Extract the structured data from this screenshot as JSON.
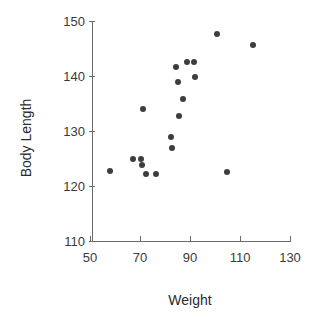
{
  "chart_data": {
    "type": "scatter",
    "title": "",
    "xlabel": "Weight",
    "ylabel": "Body Length",
    "xlim": [
      50,
      130
    ],
    "ylim": [
      110,
      150
    ],
    "xticks": [
      50,
      70,
      90,
      110,
      130
    ],
    "yticks": [
      110,
      120,
      130,
      140,
      150
    ],
    "grid": false,
    "legend": null,
    "marker": {
      "shape": "circle",
      "color": "#3d3d3d",
      "size_px": 6
    },
    "axis_color": "#6b6b6b",
    "series": [
      {
        "name": "observations",
        "points": [
          {
            "x": 58.0,
            "y": 122.7
          },
          {
            "x": 67.2,
            "y": 124.9
          },
          {
            "x": 70.4,
            "y": 124.9
          },
          {
            "x": 70.8,
            "y": 123.8
          },
          {
            "x": 71.2,
            "y": 134.0
          },
          {
            "x": 72.4,
            "y": 122.2
          },
          {
            "x": 76.4,
            "y": 122.2
          },
          {
            "x": 82.4,
            "y": 128.9
          },
          {
            "x": 82.8,
            "y": 126.9
          },
          {
            "x": 84.4,
            "y": 141.6
          },
          {
            "x": 85.2,
            "y": 138.9
          },
          {
            "x": 85.6,
            "y": 132.8
          },
          {
            "x": 87.2,
            "y": 135.9
          },
          {
            "x": 88.8,
            "y": 142.6
          },
          {
            "x": 91.6,
            "y": 142.6
          },
          {
            "x": 92.0,
            "y": 139.8
          },
          {
            "x": 100.8,
            "y": 147.7
          },
          {
            "x": 104.8,
            "y": 122.6
          },
          {
            "x": 115.2,
            "y": 145.7
          }
        ]
      }
    ]
  },
  "axes": {
    "x": {
      "title": "Weight",
      "tick_labels": [
        "50",
        "70",
        "90",
        "110",
        "130"
      ]
    },
    "y": {
      "title": "Body Length",
      "tick_labels": [
        "110",
        "120",
        "130",
        "140",
        "150"
      ]
    }
  }
}
